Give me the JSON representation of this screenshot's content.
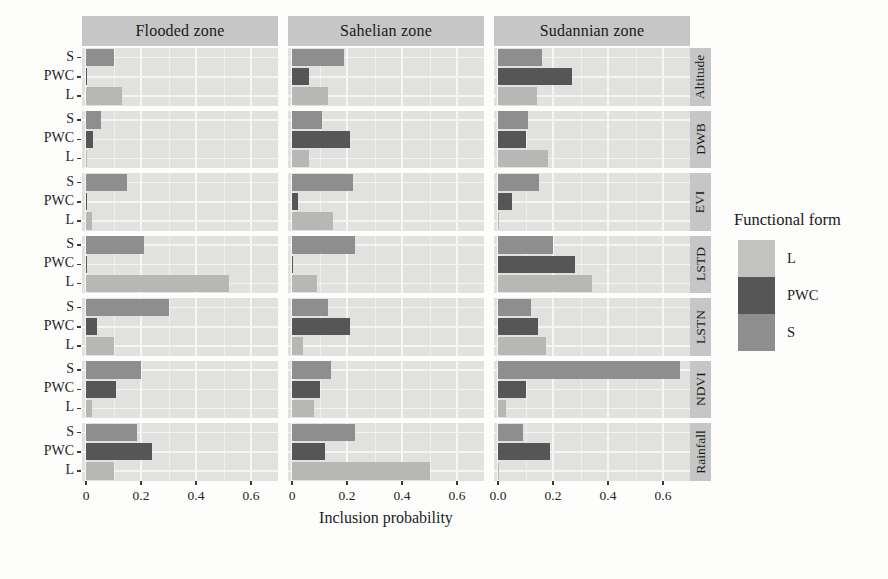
{
  "figure": {
    "kind": "faceted-horizontal-bar-chart",
    "background": "#fdfdfc"
  },
  "chart_data": {
    "type": "bar",
    "orientation": "horizontal",
    "title": "",
    "xlabel": "Inclusion probability",
    "facet_columns": [
      "Flooded zone",
      "Sahelian zone",
      "Sudannian zone"
    ],
    "facet_rows": [
      "Altitude",
      "DWB",
      "EVI",
      "LSTD",
      "LSTN",
      "NDVI",
      "Rainfall"
    ],
    "categories_top_to_bottom": [
      "S",
      "PWC",
      "L"
    ],
    "xlim": [
      0,
      0.7
    ],
    "x_ticks": [
      0,
      0.2,
      0.4,
      0.6
    ],
    "x_tick_labels_by_column": [
      [
        "0",
        "0.2",
        "0.4",
        "0.6"
      ],
      [
        "0",
        "0.2",
        "0.4",
        "0.6"
      ],
      [
        "0.0",
        "0.2",
        "0.4",
        "0.6"
      ]
    ],
    "grid": {
      "major": true,
      "minor": true,
      "gridline_color": "#f6f6f5"
    },
    "colors": {
      "S": "#8e8e8e",
      "PWC": "#565656",
      "L": "#b7b7b6",
      "panel_background": "#e1e1e0",
      "strip_background": "#c6c6c6"
    },
    "legend": {
      "title": "Functional form",
      "position": "right",
      "entries": [
        {
          "label": "L",
          "color": "#c2c2c1"
        },
        {
          "label": "PWC",
          "color": "#565656"
        },
        {
          "label": "S",
          "color": "#8e8e8e"
        }
      ]
    },
    "values_order": "values[column][row] = [S, PWC, L]",
    "values": [
      [
        [
          0.1,
          0.005,
          0.13
        ],
        [
          0.055,
          0.025,
          0.005
        ],
        [
          0.15,
          0.005,
          0.02
        ],
        [
          0.21,
          0.005,
          0.52
        ],
        [
          0.3,
          0.04,
          0.1
        ],
        [
          0.2,
          0.11,
          0.02
        ],
        [
          0.185,
          0.24,
          0.1
        ]
      ],
      [
        [
          0.19,
          0.06,
          0.13
        ],
        [
          0.11,
          0.21,
          0.06
        ],
        [
          0.22,
          0.02,
          0.15
        ],
        [
          0.23,
          0.005,
          0.09
        ],
        [
          0.13,
          0.21,
          0.04
        ],
        [
          0.14,
          0.1,
          0.08
        ],
        [
          0.23,
          0.12,
          0.5
        ]
      ],
      [
        [
          0.16,
          0.27,
          0.14
        ],
        [
          0.11,
          0.1,
          0.18
        ],
        [
          0.15,
          0.05,
          0.005
        ],
        [
          0.2,
          0.28,
          0.34
        ],
        [
          0.12,
          0.145,
          0.175
        ],
        [
          0.66,
          0.1,
          0.03
        ],
        [
          0.09,
          0.19,
          0.005
        ]
      ]
    ]
  }
}
